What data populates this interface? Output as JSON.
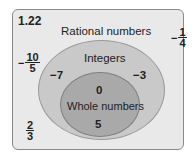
{
  "figure_number": "1.22",
  "sets": {
    "rational": {
      "label": "Rational numbers",
      "color": "#e9e9e9"
    },
    "integers": {
      "label": "Integers",
      "color": "#c9c9c9"
    },
    "whole": {
      "label": "Whole numbers",
      "color": "#a9a9a9"
    }
  },
  "members": {
    "rational_only": [
      {
        "sign": "−",
        "num": "1",
        "den": "4"
      },
      {
        "sign": "−",
        "num": "10",
        "den": "5"
      },
      {
        "sign": "",
        "num": "2",
        "den": "3"
      }
    ],
    "integers_only": [
      "−7",
      "−3"
    ],
    "whole": [
      "0",
      "5"
    ]
  }
}
